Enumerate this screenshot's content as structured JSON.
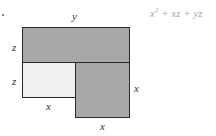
{
  "diagram": {
    "formula": {
      "var1": "x",
      "exp": "2",
      "rest": " + xz + yz"
    },
    "labels": {
      "top": "y",
      "left_upper": "z",
      "left_lower": "z",
      "bottom_light": "x",
      "right": "x",
      "bottom_right": "x"
    },
    "regions": [
      {
        "name": "top-rect",
        "dims": "y by z",
        "fill": "#a8a8a8"
      },
      {
        "name": "light-rect",
        "dims": "x by z",
        "fill": "#f0f0f0"
      },
      {
        "name": "square",
        "dims": "x by x",
        "fill": "#a8a8a8"
      }
    ]
  }
}
